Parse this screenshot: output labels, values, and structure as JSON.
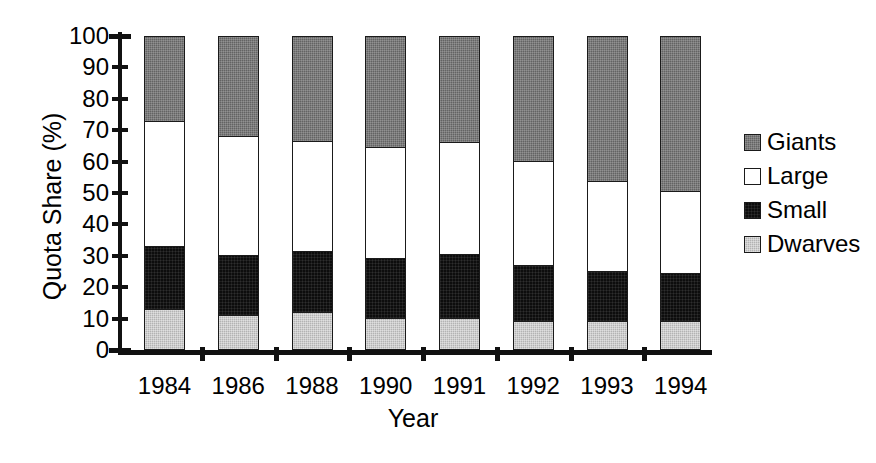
{
  "chart_data": {
    "type": "bar",
    "subtype": "stacked-100",
    "title": "",
    "xlabel": "Year",
    "ylabel": "Quota Share (%)",
    "ylim": [
      0,
      100
    ],
    "ytick_step": 10,
    "yticks": [
      "0",
      "10",
      "20",
      "30",
      "40",
      "50",
      "60",
      "70",
      "80",
      "90",
      "100"
    ],
    "grid": false,
    "legend_position": "right",
    "categories": [
      "1984",
      "1986",
      "1988",
      "1990",
      "1991",
      "1992",
      "1993",
      "1994"
    ],
    "series": [
      {
        "name": "Dwarves",
        "color": "#b3b3b3",
        "values": [
          12.4,
          10.5,
          11.5,
          9.5,
          9.5,
          8.6,
          8.6,
          8.5
        ]
      },
      {
        "name": "Small",
        "color": "#0d0d0d",
        "values": [
          20.1,
          19.1,
          19.5,
          19.2,
          20.5,
          17.8,
          15.9,
          15.5
        ]
      },
      {
        "name": "Large",
        "color": "#ffffff",
        "values": [
          39.8,
          37.9,
          35.0,
          35.3,
          35.6,
          33.1,
          28.7,
          26.0
        ]
      },
      {
        "name": "Giants",
        "color": "#636363",
        "values": [
          27.7,
          32.5,
          34.0,
          36.0,
          34.4,
          40.5,
          46.8,
          50.0
        ]
      }
    ],
    "cumulative_tops": {
      "dwarves": [
        12.4,
        10.5,
        11.5,
        9.5,
        9.5,
        8.6,
        8.6,
        8.5
      ],
      "small": [
        32.5,
        29.6,
        31.0,
        28.7,
        30.0,
        26.4,
        24.5,
        24.0
      ],
      "large": [
        72.3,
        67.5,
        66.0,
        64.0,
        65.6,
        59.5,
        53.2,
        50.0
      ],
      "giants": [
        100,
        100,
        100,
        100,
        100,
        100,
        100,
        100
      ]
    }
  },
  "axes": {
    "y_title": "Quota Share (%)",
    "x_title": "Year"
  },
  "legend": {
    "items": [
      {
        "label": "Giants",
        "color": "#636363"
      },
      {
        "label": "Large",
        "color": "#ffffff"
      },
      {
        "label": "Small",
        "color": "#0d0d0d"
      },
      {
        "label": "Dwarves",
        "color": "#b3b3b3"
      }
    ]
  }
}
